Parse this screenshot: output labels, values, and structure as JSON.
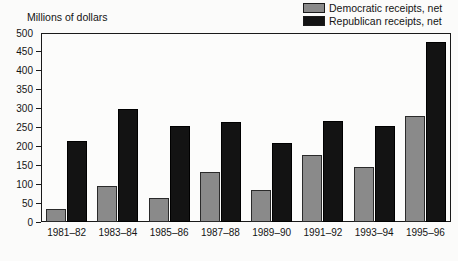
{
  "chart_data": {
    "type": "bar",
    "title": "",
    "subtitle": "",
    "xlabel": "",
    "ylabel": "Millions of dollars",
    "ylim": [
      0,
      500
    ],
    "y_ticks": [
      0,
      50,
      100,
      150,
      200,
      250,
      300,
      350,
      400,
      450,
      500
    ],
    "grid": false,
    "legend_position": "top-right",
    "categories": [
      "1981–82",
      "1983–84",
      "1985–86",
      "1987–88",
      "1989–90",
      "1991–92",
      "1993–94",
      "1995–96"
    ],
    "series": [
      {
        "name": "Democratic receipts, net",
        "color": "#8a8a8a",
        "values": [
          35,
          95,
          63,
          132,
          85,
          178,
          145,
          280
        ]
      },
      {
        "name": "Republican receipts, net",
        "color": "#131313",
        "values": [
          215,
          300,
          255,
          265,
          208,
          268,
          255,
          475
        ]
      }
    ]
  },
  "legend": {
    "items": [
      {
        "label": "Democratic receipts, net",
        "swatch": "#8a8a8a",
        "icon": "legend-swatch-icon"
      },
      {
        "label": "Republican receipts, net",
        "swatch": "#131313",
        "icon": "legend-swatch-icon"
      }
    ]
  }
}
